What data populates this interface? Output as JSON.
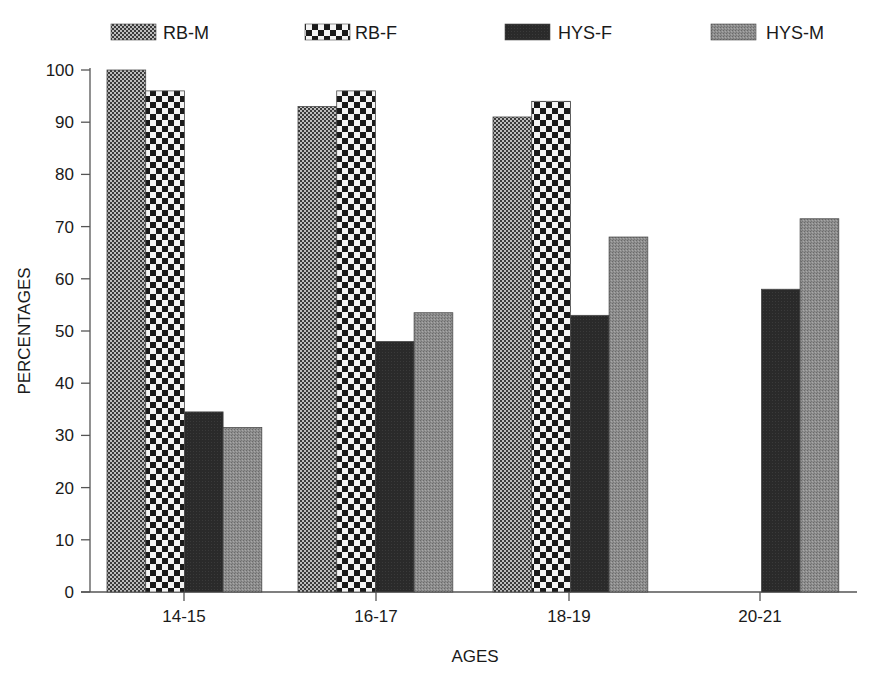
{
  "chart_data": {
    "type": "bar",
    "title": "",
    "xlabel": "AGES",
    "ylabel": "PERCENTAGES",
    "ylim": [
      0,
      100
    ],
    "yticks": [
      0,
      10,
      20,
      30,
      40,
      50,
      60,
      70,
      80,
      90,
      100
    ],
    "grid": false,
    "legend_position": "top",
    "categories": [
      "14-15",
      "16-17",
      "18-19",
      "20-21"
    ],
    "series": [
      {
        "name": "RB-M",
        "pattern": "fine-checker",
        "color": "#6e6e6e",
        "values": [
          100,
          93,
          91,
          null
        ]
      },
      {
        "name": "RB-F",
        "pattern": "coarse-checker",
        "color": "#1a1a1a",
        "values": [
          96,
          96,
          94,
          null
        ]
      },
      {
        "name": "HYS-F",
        "pattern": "solid-dark",
        "color": "#262626",
        "values": [
          34.5,
          48,
          53,
          58
        ]
      },
      {
        "name": "HYS-M",
        "pattern": "stipple-gray",
        "color": "#8a8a8a",
        "values": [
          31.5,
          53.5,
          68,
          71.5
        ]
      }
    ]
  }
}
